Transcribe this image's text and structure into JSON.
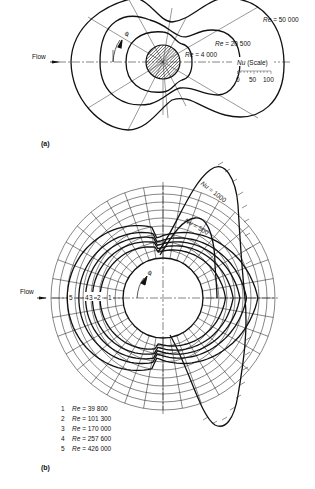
{
  "figure_a": {
    "panel_label": "(a)",
    "flow_label": "Flow",
    "angle_symbol": "φ",
    "curves": [
      {
        "re_prefix": "Re",
        "label": "Re = 50 000",
        "value_text": "= 50 000"
      },
      {
        "re_prefix": "Re",
        "label": "Re = 20 500",
        "value_text": "= 20 500"
      },
      {
        "re_prefix": "Re",
        "label": "Re = 4 000",
        "value_text": "= 4 000"
      }
    ],
    "scale": {
      "title_symbol": "Nu",
      "title_suffix": "(Scale)",
      "ticks": [
        "0",
        "50",
        "100"
      ]
    }
  },
  "figure_b": {
    "panel_label": "(b)",
    "flow_label": "Flow",
    "angle_symbol": "φ",
    "curve_numbers": [
      "5",
      "4",
      "3",
      "2",
      "1"
    ],
    "nu_labels": [
      {
        "symbol": "Nu",
        "value_text": "= 1000"
      },
      {
        "symbol": "Nu",
        "value_text": "= 500"
      }
    ],
    "legend": [
      {
        "num": "1",
        "symbol": "Re",
        "value_text": "= 39 800"
      },
      {
        "num": "2",
        "symbol": "Re",
        "value_text": "= 101 300"
      },
      {
        "num": "3",
        "symbol": "Re",
        "value_text": "= 170 000"
      },
      {
        "num": "4",
        "symbol": "Re",
        "value_text": "= 257 600"
      },
      {
        "num": "5",
        "symbol": "Re",
        "value_text": "= 426 000"
      }
    ]
  }
}
